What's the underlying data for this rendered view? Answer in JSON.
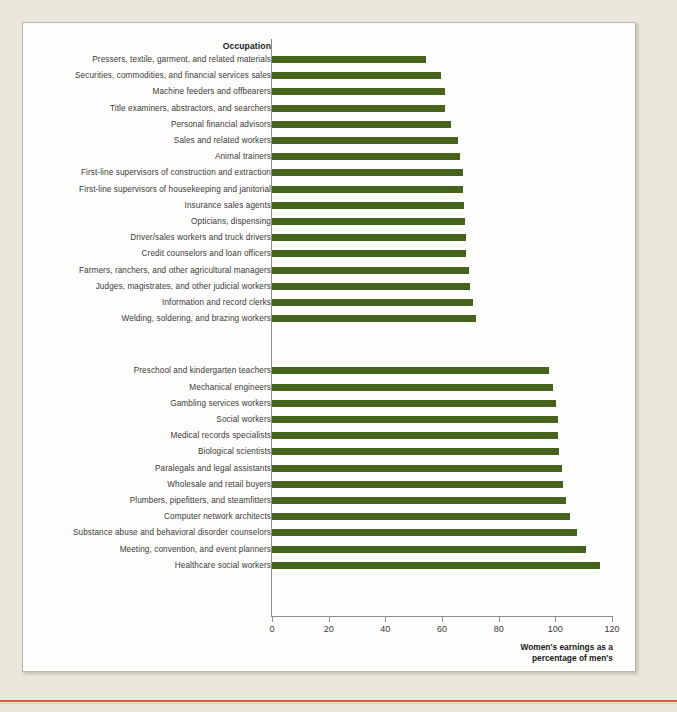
{
  "chart_data": {
    "type": "bar",
    "orientation": "horizontal",
    "title": "",
    "xlabel": "Women's earnings as a percentage of men's",
    "ylabel": "Occupation",
    "xlim": [
      0,
      120
    ],
    "xticks": [
      0,
      20,
      40,
      60,
      80,
      100,
      120
    ],
    "grid": false,
    "legend": null,
    "bar_color": "#46631d",
    "groups": [
      {
        "name": "lowest-ratio-occupations",
        "categories": [
          "Pressers, textile, garment, and related materials",
          "Securities, commodities, and financial services sales",
          "Machine feeders and offbearers",
          "Title examiners, abstractors, and searchers",
          "Personal financial advisors",
          "Sales and related workers",
          "Animal trainers",
          "First-line supervisors of construction and extraction",
          "First-line supervisors of housekeeping and janitorial",
          "Insurance sales agents",
          "Opticians, dispensing",
          "Driver/sales workers and truck drivers",
          "Credit counselors and loan officers",
          "Farmers, ranchers, and other agricultural managers",
          "Judges, magistrates, and other judicial workers",
          "Information and record clerks",
          "Welding, soldering, and brazing workers"
        ],
        "values": [
          54.5,
          59.8,
          61.0,
          61.2,
          63.2,
          65.5,
          66.5,
          67.3,
          67.4,
          67.6,
          68.0,
          68.4,
          68.6,
          69.4,
          69.8,
          71.1,
          72.0
        ]
      },
      {
        "name": "highest-ratio-occupations",
        "categories": [
          "Preschool and kindergarten teachers",
          "Mechanical engineers",
          "Gambling services workers",
          "Social workers",
          "Medical records specialists",
          "Biological scientists",
          "Paralegals and legal assistants",
          "Wholesale and retail buyers",
          "Plumbers, pipefitters, and steamfitters",
          "Computer network architects",
          "Substance abuse and behavioral disorder counselors",
          "Meeting, convention, and event planners",
          "Healthcare social workers"
        ],
        "values": [
          97.8,
          99.3,
          100.4,
          100.8,
          101.0,
          101.3,
          102.3,
          102.7,
          103.8,
          105.0,
          107.7,
          110.8,
          115.8
        ]
      }
    ]
  },
  "axis": {
    "occupation_header": "Occupation",
    "caption_line1": "Women's earnings as a",
    "caption_line2": "percentage of men's",
    "tick_labels": [
      "0",
      "20",
      "40",
      "60",
      "80",
      "100",
      "120"
    ]
  }
}
